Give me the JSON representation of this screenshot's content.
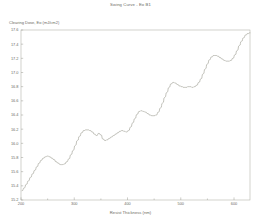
{
  "chart_data": {
    "type": "line",
    "title": "Swing Curve - Eo B1",
    "xlabel": "Resist Thickness (nm)",
    "ylabel": "Clearing Dose, Eo (mJ/cm2)",
    "xlim": [
      200,
      630
    ],
    "ylim": [
      15.2,
      17.6
    ],
    "xticks": [
      200,
      300,
      400,
      500,
      600
    ],
    "xtick_labels": [
      "200",
      "300",
      "400",
      "500",
      "600"
    ],
    "yticks": [
      15.2,
      15.4,
      15.6,
      15.8,
      16.0,
      16.2,
      16.4,
      16.6,
      16.8,
      17.0,
      17.2,
      17.4,
      17.6
    ],
    "ytick_labels": [
      "15.2",
      "15.4",
      "15.6",
      "15.8",
      "16.0",
      "16.2",
      "16.4",
      "16.6",
      "16.8",
      "17.0",
      "17.2",
      "17.4",
      "17.6"
    ],
    "x_minor_ticks": [
      250,
      350,
      450,
      550
    ],
    "grid": false,
    "legend": null,
    "series": [
      {
        "name": "Eo B1",
        "color": "#a8a89e",
        "x": [
          202,
          206,
          210,
          214,
          218,
          222,
          226,
          230,
          234,
          238,
          242,
          246,
          250,
          254,
          258,
          262,
          266,
          270,
          274,
          278,
          282,
          286,
          290,
          294,
          298,
          302,
          306,
          310,
          314,
          318,
          322,
          326,
          330,
          334,
          338,
          342,
          346,
          350,
          354,
          358,
          362,
          366,
          370,
          374,
          378,
          382,
          386,
          390,
          394,
          398,
          402,
          406,
          410,
          414,
          418,
          422,
          426,
          430,
          434,
          438,
          442,
          446,
          450,
          454,
          458,
          462,
          466,
          470,
          474,
          478,
          482,
          486,
          490,
          494,
          498,
          502,
          506,
          510,
          514,
          518,
          522,
          526,
          530,
          534,
          538,
          542,
          546,
          550,
          554,
          558,
          562,
          566,
          570,
          574,
          578,
          582,
          586,
          590,
          594,
          598,
          602,
          606,
          610,
          614,
          618,
          622,
          626,
          630
        ],
        "y": [
          15.33,
          15.37,
          15.42,
          15.47,
          15.52,
          15.57,
          15.62,
          15.67,
          15.72,
          15.76,
          15.79,
          15.81,
          15.82,
          15.81,
          15.79,
          15.77,
          15.74,
          15.72,
          15.7,
          15.7,
          15.71,
          15.74,
          15.78,
          15.84,
          15.9,
          15.97,
          16.04,
          16.1,
          16.15,
          16.18,
          16.19,
          16.19,
          16.18,
          16.16,
          16.13,
          16.11,
          16.14,
          16.12,
          16.06,
          16.04,
          16.05,
          16.07,
          16.09,
          16.11,
          16.13,
          16.15,
          16.17,
          16.18,
          16.17,
          16.16,
          16.18,
          16.23,
          16.29,
          16.35,
          16.41,
          16.45,
          16.46,
          16.45,
          16.44,
          16.42,
          16.4,
          16.39,
          16.39,
          16.4,
          16.44,
          16.5,
          16.57,
          16.65,
          16.72,
          16.79,
          16.84,
          16.86,
          16.85,
          16.83,
          16.81,
          16.8,
          16.79,
          16.79,
          16.8,
          16.8,
          16.79,
          16.8,
          16.82,
          16.86,
          16.91,
          16.98,
          17.05,
          17.12,
          17.18,
          17.22,
          17.24,
          17.24,
          17.23,
          17.21,
          17.19,
          17.17,
          17.16,
          17.16,
          17.17,
          17.2,
          17.25,
          17.31,
          17.38,
          17.44,
          17.49,
          17.53,
          17.55,
          17.56
        ]
      }
    ]
  },
  "colors": {
    "curve": "#a8a89e",
    "axis": "#b4b4ac",
    "text": "#6b6b63",
    "background": "#ffffff"
  }
}
